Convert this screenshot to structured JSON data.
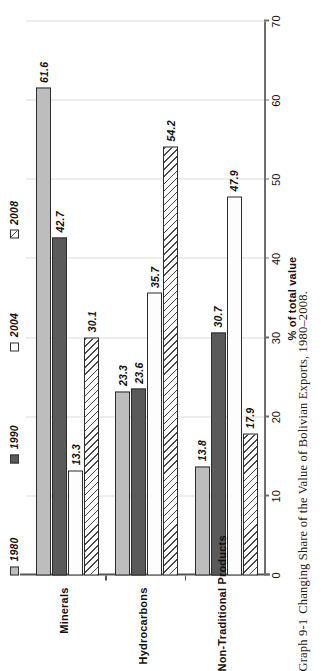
{
  "figure": {
    "caption_number": "Graph 9-1",
    "caption_text": "Changing Share of the Value of Bolivian Exports, 1980–2008."
  },
  "chart_data": {
    "type": "bar",
    "orientation": "horizontal",
    "title": "",
    "xlabel": "% of total value",
    "ylabel": "",
    "xlim": [
      0,
      70
    ],
    "grid": true,
    "legend_position": "top",
    "categories": [
      "Minerals",
      "Hydrocarbons",
      "Non-Traditional Products"
    ],
    "series": [
      {
        "name": "1980",
        "style": "solid-light-gray",
        "color": "#bdbdbd",
        "values": [
          61.6,
          23.3,
          13.8
        ]
      },
      {
        "name": "1990",
        "style": "solid-dark-gray",
        "color": "#5a5a5a",
        "values": [
          42.7,
          23.6,
          30.7
        ]
      },
      {
        "name": "2004",
        "style": "solid-white",
        "color": "#fdfdfd",
        "values": [
          13.3,
          35.7,
          47.9
        ]
      },
      {
        "name": "2008",
        "style": "diagonal-hatch",
        "color": "#fcfcfc",
        "values": [
          30.1,
          54.2,
          17.9
        ]
      }
    ],
    "value_labels": {
      "Minerals": [
        "61.6",
        "42.7",
        "13.3",
        "30.1"
      ],
      "Hydrocarbons": [
        "23.3",
        "23.6",
        "35.7",
        "54.2"
      ],
      "Non-Traditional Products": [
        "13.8",
        "30.7",
        "47.9",
        "17.9"
      ]
    },
    "axis_ticks": [
      "0",
      "10",
      "20",
      "30",
      "40",
      "50",
      "60",
      "70"
    ],
    "axis_tick_values": [
      0,
      10,
      20,
      30,
      40,
      50,
      60,
      70
    ]
  },
  "legend": {
    "items": [
      {
        "label": "1980"
      },
      {
        "label": "1990"
      },
      {
        "label": "2004"
      },
      {
        "label": "2008"
      }
    ]
  }
}
